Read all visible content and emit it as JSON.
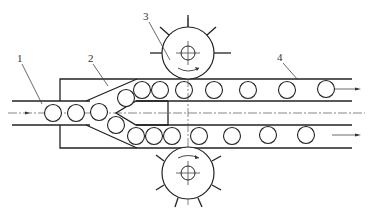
{
  "diagram": {
    "type": "mechanical-schematic",
    "labels": [
      {
        "id": "1",
        "text": "1",
        "x": 20,
        "y": 60
      },
      {
        "id": "2",
        "text": "2",
        "x": 91,
        "y": 60
      },
      {
        "id": "3",
        "text": "3",
        "x": 146,
        "y": 18
      },
      {
        "id": "4",
        "text": "4",
        "x": 280,
        "y": 59
      }
    ],
    "components": {
      "input_channel": "1",
      "splitter_wedge": "2",
      "star_wheel": "3",
      "output_channel": "4"
    }
  }
}
